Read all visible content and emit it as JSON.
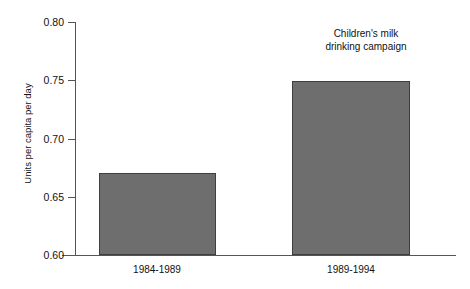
{
  "chart_data": {
    "type": "bar",
    "title": "",
    "xlabel": "",
    "ylabel": "Units per capita per day",
    "categories": [
      "1984-1989",
      "1989-1994"
    ],
    "values": [
      0.67,
      0.749
    ],
    "ylim": [
      0.6,
      0.8
    ],
    "yticks": [
      "0.80",
      "0.75",
      "0.70",
      "0.65",
      "0.60"
    ],
    "ytick_values": [
      0.8,
      0.75,
      0.7,
      0.65,
      0.6
    ],
    "grid": false,
    "legend": null,
    "bar_color": "#6e6e6e",
    "bar_edge_color": "#3f3f3f",
    "axis_color": "#555555",
    "annotations": [
      {
        "line1": "Children's milk",
        "line2": "drinking campaign",
        "target_category": "1989-1994"
      }
    ]
  },
  "axis": {
    "y_title": "Units per capita per day",
    "ticks": [
      {
        "label": "0.80"
      },
      {
        "label": "0.75"
      },
      {
        "label": "0.70"
      },
      {
        "label": "0.65"
      },
      {
        "label": "0.60"
      }
    ]
  },
  "bars": [
    {
      "label": "1984-1989",
      "value": "0.670"
    },
    {
      "label": "1989-1994",
      "value": "0.749"
    }
  ],
  "annotation": {
    "line1": "Children's milk",
    "line2": "drinking campaign"
  }
}
